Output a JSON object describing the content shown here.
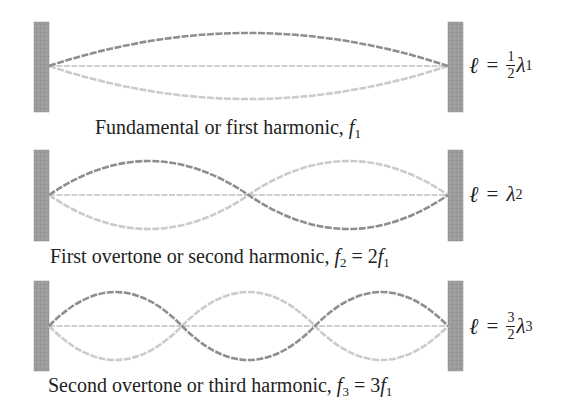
{
  "colors": {
    "wall": "#9c9c9c",
    "wall_edge": "#8a8a8a",
    "string_dark": "#8e8e8e",
    "string_light": "#c9c9c9",
    "string_rest": "#cdcdcd",
    "text": "#222222"
  },
  "panels": [
    {
      "harmonic": 1,
      "caption": {
        "text": "Fundamental or first harmonic, ",
        "freq_symbol": "f",
        "freq_sub": "1",
        "relation": ""
      },
      "equation": {
        "lhs": "ℓ",
        "op": "=",
        "frac_num": "1",
        "frac_den": "2",
        "lambda": "λ",
        "lambda_sub": "1"
      },
      "geometry": {
        "wall_top": 22,
        "wall_bottom": 112,
        "center_y": 66,
        "amplitude": 33
      }
    },
    {
      "harmonic": 2,
      "caption": {
        "text": "First overtone or second harmonic, ",
        "freq_symbol": "f",
        "freq_sub": "2",
        "relation_eq": " = 2",
        "relation_symbol": "f",
        "relation_sub": "1"
      },
      "equation": {
        "lhs": "ℓ",
        "op": "=",
        "lambda": "λ",
        "lambda_sub": "2"
      },
      "geometry": {
        "wall_top": 150,
        "wall_bottom": 241,
        "center_y": 195,
        "amplitude": 34
      }
    },
    {
      "harmonic": 3,
      "caption": {
        "text": "Second overtone or third harmonic, ",
        "freq_symbol": "f",
        "freq_sub": "3",
        "relation_eq": " = 3",
        "relation_symbol": "f",
        "relation_sub": "1"
      },
      "equation": {
        "lhs": "ℓ",
        "op": "=",
        "frac_num": "3",
        "frac_den": "2",
        "lambda": "λ",
        "lambda_sub": "3"
      },
      "geometry": {
        "wall_top": 281,
        "wall_bottom": 371,
        "center_y": 326,
        "amplitude": 34
      }
    }
  ],
  "string_span": {
    "x_left": 49,
    "x_right": 448
  },
  "walls": {
    "left_x": 34,
    "right_x": 448,
    "width": 15
  }
}
